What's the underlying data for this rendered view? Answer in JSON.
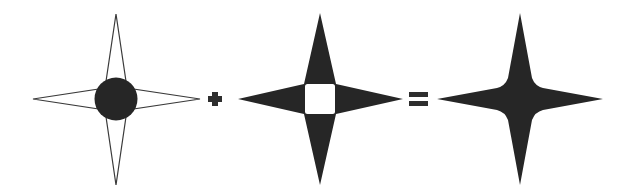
{
  "diagram": {
    "description": "Visual equation: outlined four-point star with filled circle center, plus filled four-point star with white square center, equals solid filled four-point star",
    "colors": {
      "fill": "#262626",
      "stroke": "#3a3a3a",
      "background": "#ffffff",
      "hole": "#ffffff"
    },
    "terms": [
      {
        "id": "term-1",
        "label": "Outlined star with filled circle",
        "cx": 116,
        "cy": 99,
        "arm": 84
      },
      {
        "id": "operator-plus",
        "label": "+"
      },
      {
        "id": "term-2",
        "label": "Filled star with white square hole",
        "cx": 320,
        "cy": 99,
        "arm": 84
      },
      {
        "id": "operator-equals",
        "label": "="
      },
      {
        "id": "term-3",
        "label": "Solid filled star",
        "cx": 520,
        "cy": 99,
        "arm": 84
      }
    ]
  }
}
